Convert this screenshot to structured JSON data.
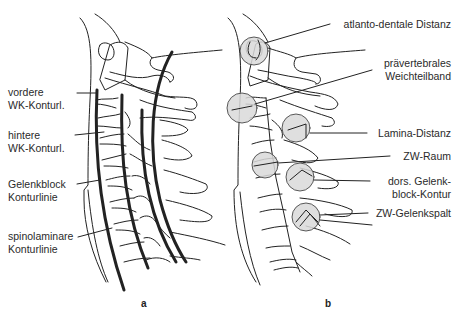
{
  "figure": {
    "panel_a": {
      "letter": "a",
      "labels": [
        {
          "line1": "vordere",
          "line2": "WK-Konturl."
        },
        {
          "line1": "hintere",
          "line2": "WK-Konturl."
        },
        {
          "line1": "Gelenkblock",
          "line2": "Konturlinie"
        },
        {
          "line1": "spinolaminare",
          "line2": "Konturlinie"
        }
      ]
    },
    "panel_b": {
      "letter": "b",
      "labels": [
        {
          "line1": "atlanto-dentale Distanz",
          "line2": ""
        },
        {
          "line1": "prävertebrales",
          "line2": "Weichteilband"
        },
        {
          "line1": "Lamina-Distanz",
          "line2": ""
        },
        {
          "line1": "ZW-Raum",
          "line2": ""
        },
        {
          "line1": "dors. Gelenk-",
          "line2": "block-Kontur"
        },
        {
          "line1": "ZW-Gelenkspalt",
          "line2": ""
        }
      ]
    },
    "colors": {
      "line": "#222222",
      "circle_fill": "#d9d9d9",
      "background": "#ffffff"
    }
  }
}
